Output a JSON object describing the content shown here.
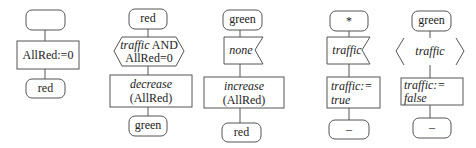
{
  "diagram": {
    "type": "SDL state transitions",
    "columns": [
      {
        "id": "col1",
        "state_from": "",
        "input": null,
        "task": "AllRed:=0",
        "state_to": "red"
      },
      {
        "id": "col2",
        "state_from": "red",
        "decision": {
          "line1": "traffic",
          "line1_rest": "AND",
          "line2": "AllRed=0"
        },
        "task": {
          "line1": "decrease",
          "line2": "(AllRed)"
        },
        "state_to": "green"
      },
      {
        "id": "col3",
        "state_from": "green",
        "input": "none",
        "task": {
          "line1": "increase",
          "line2": "(AllRed)"
        },
        "state_to": "red"
      },
      {
        "id": "col4",
        "state_from": "*",
        "input": "traffic",
        "task": {
          "line1": "traffic:=",
          "line2": "true"
        },
        "state_to": "–"
      },
      {
        "id": "col5",
        "state_from": "green",
        "decision": {
          "line1": "traffic"
        },
        "task": {
          "line1": "traffic:=",
          "line2": "false"
        },
        "state_to": "–"
      }
    ]
  },
  "colors": {
    "stroke": "#555555",
    "text": "#222222",
    "background": "#ffffff"
  }
}
